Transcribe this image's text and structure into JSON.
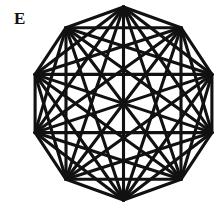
{
  "figure": {
    "label": "E",
    "title": "E",
    "background_color": "#ffffff",
    "line_color": "#111111",
    "line_width": 3.1,
    "shape": "decagon",
    "vertex_count": 10,
    "edge_count": 45,
    "center": {
      "x": 123.5,
      "y": 103.5
    },
    "radius": 96.5,
    "vertices": [
      {
        "id": "v0",
        "name": "top",
        "x": 123.5,
        "y": 7.0
      },
      {
        "id": "v1",
        "name": "upper-right",
        "x": 181.0,
        "y": 27.7
      },
      {
        "id": "v2",
        "name": "right-upper",
        "x": 211.9,
        "y": 74.4
      },
      {
        "id": "v3",
        "name": "right-lower",
        "x": 211.9,
        "y": 132.6
      },
      {
        "id": "v4",
        "name": "lower-right",
        "x": 181.0,
        "y": 179.3
      },
      {
        "id": "v5",
        "name": "bottom",
        "x": 123.5,
        "y": 200.0
      },
      {
        "id": "v6",
        "name": "lower-left",
        "x": 66.0,
        "y": 179.3
      },
      {
        "id": "v7",
        "name": "left-lower",
        "x": 35.1,
        "y": 132.6
      },
      {
        "id": "v8",
        "name": "left-upper",
        "x": 35.1,
        "y": 74.4
      },
      {
        "id": "v9",
        "name": "upper-left",
        "x": 66.0,
        "y": 27.7
      }
    ],
    "edges": [
      [
        "v0",
        "v1"
      ],
      [
        "v0",
        "v2"
      ],
      [
        "v0",
        "v3"
      ],
      [
        "v0",
        "v4"
      ],
      [
        "v0",
        "v5"
      ],
      [
        "v0",
        "v6"
      ],
      [
        "v0",
        "v7"
      ],
      [
        "v0",
        "v8"
      ],
      [
        "v0",
        "v9"
      ],
      [
        "v1",
        "v2"
      ],
      [
        "v1",
        "v3"
      ],
      [
        "v1",
        "v4"
      ],
      [
        "v1",
        "v5"
      ],
      [
        "v1",
        "v6"
      ],
      [
        "v1",
        "v7"
      ],
      [
        "v1",
        "v8"
      ],
      [
        "v1",
        "v9"
      ],
      [
        "v2",
        "v3"
      ],
      [
        "v2",
        "v4"
      ],
      [
        "v2",
        "v5"
      ],
      [
        "v2",
        "v6"
      ],
      [
        "v2",
        "v7"
      ],
      [
        "v2",
        "v8"
      ],
      [
        "v2",
        "v9"
      ],
      [
        "v3",
        "v4"
      ],
      [
        "v3",
        "v5"
      ],
      [
        "v3",
        "v6"
      ],
      [
        "v3",
        "v7"
      ],
      [
        "v3",
        "v8"
      ],
      [
        "v3",
        "v9"
      ],
      [
        "v4",
        "v5"
      ],
      [
        "v4",
        "v6"
      ],
      [
        "v4",
        "v7"
      ],
      [
        "v4",
        "v8"
      ],
      [
        "v4",
        "v9"
      ],
      [
        "v5",
        "v6"
      ],
      [
        "v5",
        "v7"
      ],
      [
        "v5",
        "v8"
      ],
      [
        "v5",
        "v9"
      ],
      [
        "v6",
        "v7"
      ],
      [
        "v6",
        "v8"
      ],
      [
        "v6",
        "v9"
      ],
      [
        "v7",
        "v8"
      ],
      [
        "v7",
        "v9"
      ],
      [
        "v8",
        "v9"
      ]
    ]
  },
  "chart_data": {
    "type": "diagram",
    "title": "E",
    "graph": "K10",
    "layout": "regular decagon",
    "nodes": 10,
    "edges": 45
  }
}
